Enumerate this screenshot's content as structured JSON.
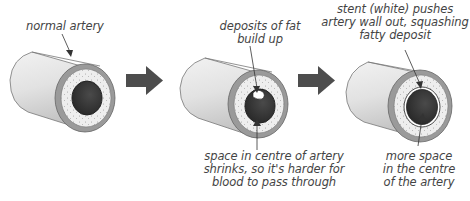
{
  "diagram": {
    "stages": [
      {
        "id": "normal",
        "labels": [
          "normal artery"
        ]
      },
      {
        "id": "blocked",
        "top_labels": [
          "deposits of fat",
          "build up"
        ],
        "bottom_labels": [
          "space in centre of artery",
          "shrinks, so it's harder for",
          "blood to pass through"
        ]
      },
      {
        "id": "stent",
        "top_labels": [
          "stent (white) pushes",
          "artery wall out, squashing",
          "fatty deposit"
        ],
        "bottom_labels": [
          "more space",
          "in the centre",
          "of the artery"
        ]
      }
    ],
    "arrows": [
      "arrow-1-to-2",
      "arrow-2-to-3"
    ],
    "colors": {
      "tube_light": "#e6e6e6",
      "tube_shadow": "#c4c4c4",
      "outer_wall": "#9a9a9a",
      "fat_layer": "#efefef",
      "lumen": "#3a3a3a",
      "arrow": "#4d4d4d",
      "text": "#444444",
      "stent": "#ffffff"
    }
  }
}
